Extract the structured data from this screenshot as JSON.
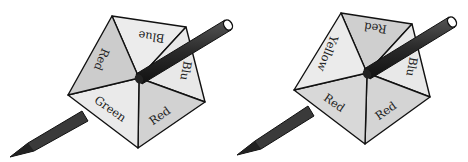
{
  "figure": {
    "colors": {
      "light_face": "#ececec",
      "medium_face": "#d4d4d4",
      "dark_face": "#c4c4c4",
      "outline": "#111111",
      "pencil": "#333333"
    }
  },
  "spinners": [
    {
      "name": "left-spinner",
      "sections": [
        {
          "label": "Blue",
          "position": "top"
        },
        {
          "label": "Blue",
          "position": "right",
          "visible_text": "Blu"
        },
        {
          "label": "Red",
          "position": "bottom-right"
        },
        {
          "label": "Green",
          "position": "bottom-left"
        },
        {
          "label": "Red",
          "position": "top-left"
        }
      ]
    },
    {
      "name": "right-spinner",
      "sections": [
        {
          "label": "Red",
          "position": "top"
        },
        {
          "label": "Blue",
          "position": "right",
          "visible_text": "Blu"
        },
        {
          "label": "Red",
          "position": "bottom-right"
        },
        {
          "label": "Red",
          "position": "bottom-left"
        },
        {
          "label": "Yellow",
          "position": "top-left"
        }
      ]
    }
  ]
}
